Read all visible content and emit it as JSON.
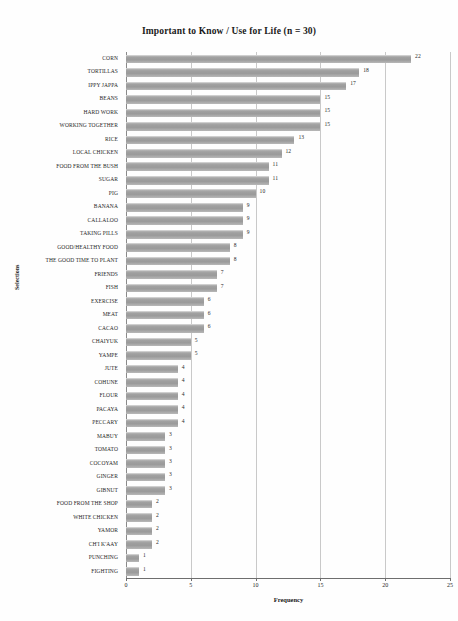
{
  "chart_data": {
    "type": "bar",
    "orientation": "horizontal",
    "title": "Important to Know / Use for Life  (n = 30)",
    "xlabel": "Frequency",
    "ylabel": "Selections",
    "xlim": [
      0,
      25
    ],
    "xticks": [
      0,
      5,
      10,
      15,
      20,
      25
    ],
    "grid": true,
    "legend": null,
    "bar_color": "#a0a0a0",
    "categories": [
      "CORN",
      "TORTILLAS",
      "IPPY JAPPA",
      "BEANS",
      "HARD WORK",
      "WORKING TOGETHER",
      "RICE",
      "LOCAL CHICKEN",
      "FOOD FROM THE BUSH",
      "SUGAR",
      "PIG",
      "BANANA",
      "CALLALOO",
      "TAKING PILLS",
      "GOOD/HEALTHY FOOD",
      "THE GOOD TIME TO PLANT",
      "FRIENDS",
      "FISH",
      "EXERCISE",
      "MEAT",
      "CACAO",
      "CHAIYUK",
      "YAMPE",
      "JUTE",
      "COHUNE",
      "FLOUR",
      "PACAYA",
      "PECCARY",
      "MABUY",
      "TOMATO",
      "COCOYAM",
      "GINGER",
      "GIBNUT",
      "FOOD FROM THE SHOP",
      "WHITE CHICKEN",
      "YAMOR",
      "CH'I K'AAY",
      "PUNCHING",
      "FIGHTING"
    ],
    "values": [
      22,
      18,
      17,
      15,
      15,
      15,
      13,
      12,
      11,
      11,
      10,
      9,
      9,
      9,
      8,
      8,
      7,
      7,
      6,
      6,
      6,
      5,
      5,
      4,
      4,
      4,
      4,
      4,
      3,
      3,
      3,
      3,
      3,
      2,
      2,
      2,
      2,
      1,
      1
    ],
    "value_labels": [
      "22",
      "18",
      "17",
      "15",
      "15",
      "15",
      "13",
      "12",
      "11",
      "11",
      "10",
      "9",
      "9",
      "9",
      "8",
      "8",
      "7",
      "7",
      "6",
      "6",
      "6",
      "5",
      "5",
      "4",
      "4",
      "4",
      "4",
      "4",
      "3",
      "3",
      "3",
      "3",
      "3",
      "2",
      "2",
      "2",
      "2",
      "1",
      "1"
    ]
  }
}
